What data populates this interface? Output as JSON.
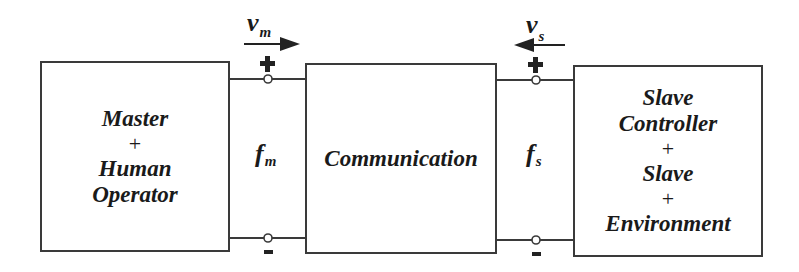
{
  "diagram": {
    "blocks": [
      {
        "id": "master",
        "lines": [
          "Master",
          "+",
          "Human",
          "Operator"
        ]
      },
      {
        "id": "communication",
        "lines": [
          "Communication"
        ]
      },
      {
        "id": "slave",
        "lines": [
          "Slave",
          "Controller",
          "+",
          "Slave",
          "+",
          "Environment"
        ]
      }
    ],
    "ports": [
      {
        "id": "master-port",
        "velocity": {
          "symbol": "v",
          "subscript": "m",
          "arrow": "right"
        },
        "force": {
          "symbol": "f",
          "subscript": "m"
        },
        "plus": "+",
        "minus": "-"
      },
      {
        "id": "slave-port",
        "velocity": {
          "symbol": "v",
          "subscript": "s",
          "arrow": "left"
        },
        "force": {
          "symbol": "f",
          "subscript": "s"
        },
        "plus": "+",
        "minus": "-"
      }
    ],
    "colors": {
      "stroke": "#3a3a3a",
      "text": "#1a1a1a",
      "background": "#ffffff"
    }
  }
}
